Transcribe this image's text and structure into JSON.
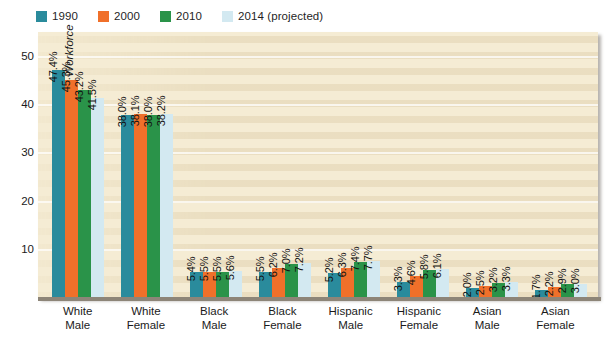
{
  "chart_data": {
    "type": "bar",
    "title": "",
    "xlabel": "",
    "ylabel": "Percentage of U.S. Workforce",
    "ylim": [
      0,
      55
    ],
    "yticks": [
      10,
      20,
      30,
      40,
      50
    ],
    "grid": true,
    "legend_position": "top-left",
    "categories": [
      {
        "line1": "White",
        "line2": "Male"
      },
      {
        "line1": "White",
        "line2": "Female"
      },
      {
        "line1": "Black",
        "line2": "Male"
      },
      {
        "line1": "Black",
        "line2": "Female"
      },
      {
        "line1": "Hispanic",
        "line2": "Male"
      },
      {
        "line1": "Hispanic",
        "line2": "Female"
      },
      {
        "line1": "Asian",
        "line2": "Male"
      },
      {
        "line1": "Asian",
        "line2": "Female"
      }
    ],
    "series": [
      {
        "name": "1990",
        "color": "#2a8b9c",
        "values": [
          47.4,
          38.0,
          5.4,
          5.5,
          5.2,
          3.3,
          2.0,
          1.7
        ],
        "labels": [
          "47.4%",
          "38.0%",
          "5.4%",
          "5.5%",
          "5.2%",
          "3.3%",
          "2.0%",
          "1.7%"
        ]
      },
      {
        "name": "2000",
        "color": "#f0702a",
        "values": [
          45.3,
          38.1,
          5.5,
          6.2,
          6.3,
          4.6,
          2.5,
          2.2
        ],
        "labels": [
          "45.3%",
          "38.1%",
          "5.5%",
          "6.2%",
          "6.3%",
          "4.6%",
          "2.5%",
          "2.2%"
        ]
      },
      {
        "name": "2010",
        "color": "#2a9349",
        "values": [
          43.2,
          38.0,
          5.5,
          7.0,
          7.4,
          5.8,
          3.2,
          2.9
        ],
        "labels": [
          "43.2%",
          "38.0%",
          "5.5%",
          "7.0%",
          "7.4%",
          "5.8%",
          "3.2%",
          "2.9%"
        ]
      },
      {
        "name": "2014 (projected)",
        "color": "#d3e9f1",
        "values": [
          41.5,
          38.2,
          5.6,
          7.2,
          7.7,
          6.1,
          3.3,
          3.0
        ],
        "labels": [
          "41.5%",
          "38.2%",
          "5.6%",
          "7.2%",
          "7.7%",
          "6.1%",
          "3.3%",
          "3.0%"
        ]
      }
    ]
  },
  "style": {
    "plot_background": "#f5ecd4",
    "page_background": "#ffffff",
    "axis_line_color": "#8d8578",
    "gridline_color": "#ffffff"
  }
}
